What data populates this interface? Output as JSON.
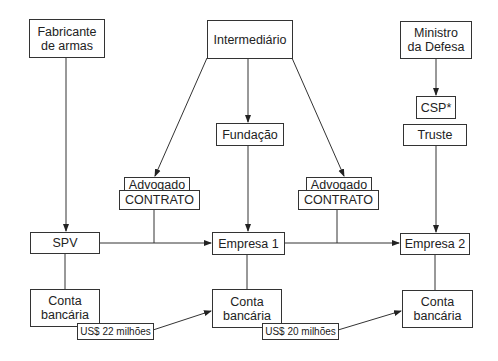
{
  "diagram": {
    "nodes": {
      "fabricante": {
        "line1": "Fabricante",
        "line2": "de armas"
      },
      "intermediario": {
        "label": "Intermediário"
      },
      "ministro": {
        "line1": "Ministro",
        "line2": "da Defesa"
      },
      "csp": {
        "label": "CSP*"
      },
      "truste": {
        "label": "Truste"
      },
      "fundacao": {
        "label": "Fundação"
      },
      "advogado_left": {
        "label": "Advogado"
      },
      "contrato_left": {
        "label": "CONTRATO"
      },
      "advogado_right": {
        "label": "Advogado"
      },
      "contrato_right": {
        "label": "CONTRATO"
      },
      "spv": {
        "label": "SPV"
      },
      "empresa1": {
        "label": "Empresa 1"
      },
      "empresa2": {
        "label": "Empresa 2"
      },
      "conta_left": {
        "line1": "Conta",
        "line2": "bancária"
      },
      "conta_mid": {
        "line1": "Conta",
        "line2": "bancária"
      },
      "conta_right": {
        "line1": "Conta",
        "line2": "bancária"
      }
    },
    "transfers": {
      "t1": {
        "label": "US$ 22 milhões"
      },
      "t2": {
        "label": "US$ 20 milhões"
      }
    },
    "edges": [
      {
        "from": "Fabricante de armas",
        "to": "SPV"
      },
      {
        "from": "Intermediário",
        "to": "Advogado (left)"
      },
      {
        "from": "Intermediário",
        "to": "Fundação"
      },
      {
        "from": "Intermediário",
        "to": "Advogado (right)"
      },
      {
        "from": "Fundação",
        "to": "Empresa 1"
      },
      {
        "from": "Ministro da Defesa",
        "to": "CSP*"
      },
      {
        "from": "Truste",
        "to": "Empresa 2"
      },
      {
        "from": "SPV",
        "to": "Empresa 1",
        "via": "CONTRATO"
      },
      {
        "from": "Empresa 1",
        "to": "Empresa 2",
        "via": "CONTRATO"
      },
      {
        "from": "Conta bancária (SPV)",
        "to": "Conta bancária (Empresa 1)",
        "amount": "US$ 22 milhões"
      },
      {
        "from": "Conta bancária (Empresa 1)",
        "to": "Conta bancária (Empresa 2)",
        "amount": "US$ 20 milhões"
      }
    ],
    "colors": {
      "line": "#333333",
      "background": "#ffffff"
    }
  }
}
